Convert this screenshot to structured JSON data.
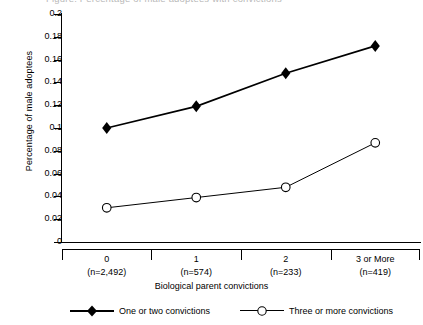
{
  "figure": {
    "cropped_title": "Figure. Percentage of male adoptees with convictions",
    "ylabel": "Percentage of male adoptees",
    "xlabel": "Biological parent convictions"
  },
  "yticks": [
    {
      "label": "0.2",
      "value": 0.2
    },
    {
      "label": "0.18",
      "value": 0.18
    },
    {
      "label": "0.16",
      "value": 0.16
    },
    {
      "label": "0.14",
      "value": 0.14
    },
    {
      "label": "0.12",
      "value": 0.12
    },
    {
      "label": "0.1",
      "value": 0.1
    },
    {
      "label": "0.08",
      "value": 0.08
    },
    {
      "label": "0.06",
      "value": 0.06
    },
    {
      "label": "0.04",
      "value": 0.04
    },
    {
      "label": "0.02",
      "value": 0.02
    },
    {
      "label": "0",
      "value": 0
    }
  ],
  "categories": [
    {
      "label": "0",
      "n": "(n=2,492)"
    },
    {
      "label": "1",
      "n": "(n=574)"
    },
    {
      "label": "2",
      "n": "(n=233)"
    },
    {
      "label": "3 or More",
      "n": "(n=419)"
    }
  ],
  "legend": [
    {
      "label": "One or two convictions",
      "marker": "filled-diamond-marker"
    },
    {
      "label": "Three or more convictions",
      "marker": "open-circle-marker"
    }
  ],
  "chart_data": {
    "type": "line",
    "title": "Percentage of male adoptees with convictions",
    "xlabel": "Biological parent convictions",
    "ylabel": "Percentage of male adoptees",
    "categories": [
      "0",
      "1",
      "2",
      "3 or More"
    ],
    "category_counts": [
      "(n=2,492)",
      "(n=574)",
      "(n=233)",
      "(n=419)"
    ],
    "series": [
      {
        "name": "One or two convictions",
        "marker": "filled-diamond",
        "color": "#000000",
        "values": [
          0.1,
          0.119,
          0.148,
          0.172
        ]
      },
      {
        "name": "Three or more convictions",
        "marker": "open-circle",
        "color": "#000000",
        "values": [
          0.03,
          0.039,
          0.048,
          0.087
        ]
      }
    ],
    "ylim": [
      0,
      0.2
    ],
    "ytick_step": 0.02,
    "grid": false,
    "legend_position": "bottom"
  }
}
